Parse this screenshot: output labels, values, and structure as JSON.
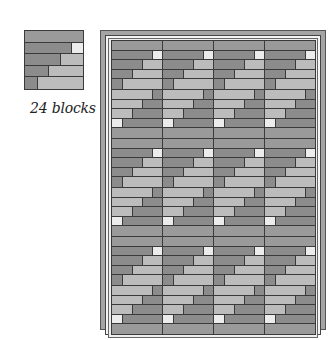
{
  "caption": "24 blocks",
  "colors": {
    "dark": "#8c8c8c",
    "darkTop": "#9a9a9a",
    "light": "#bcbcbc",
    "white": "#ececec",
    "outline": "#3a3a3a",
    "frame": "#a4a4a4"
  },
  "single_block": {
    "x": 24,
    "y": 30,
    "size": 60,
    "rows": [
      [
        [
          "dark",
          5
        ]
      ],
      [
        [
          "dark",
          4
        ],
        [
          "white",
          1
        ]
      ],
      [
        [
          "dark",
          3
        ],
        [
          "light",
          2
        ]
      ],
      [
        [
          "dark",
          2
        ],
        [
          "light",
          3
        ]
      ],
      [
        [
          "dark",
          1
        ],
        [
          "light",
          4
        ]
      ]
    ]
  },
  "quilt": {
    "columns": 4,
    "rows": 6,
    "block_width": 51,
    "block_height": 49,
    "row_orientation": [
      "normal",
      "rotated",
      "normal",
      "rotated",
      "normal",
      "rotated"
    ],
    "rotated_rows": [
      [
        [
          "light",
          4
        ],
        [
          "dark",
          1
        ]
      ],
      [
        [
          "light",
          3
        ],
        [
          "dark",
          2
        ]
      ],
      [
        [
          "light",
          2
        ],
        [
          "dark",
          3
        ]
      ],
      [
        [
          "white",
          1
        ],
        [
          "dark",
          4
        ]
      ],
      [
        [
          "dark",
          5
        ]
      ]
    ]
  }
}
